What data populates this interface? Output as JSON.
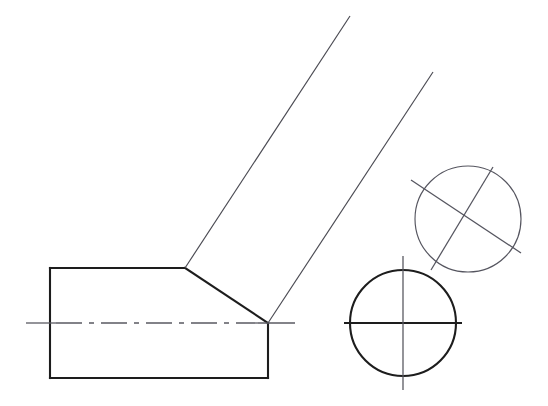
{
  "drawing": {
    "title": "Bent cylindrical part - orthographic technical drawing",
    "canvas": {
      "width": 548,
      "height": 406,
      "background": "#ffffff"
    },
    "colors": {
      "visible_edge": "#1d1d1d",
      "thin_edge": "#4a4a52",
      "center_line": "#5a5a62",
      "light_circle": "#55555f"
    },
    "views": [
      {
        "name": "front-view-bent-bar",
        "label": "Front view - bent bar with chamfered elbow",
        "axis_y": 323
      },
      {
        "name": "section-view-lower-circle",
        "label": "Section view - circular cross-section upright",
        "center_x": 403,
        "center_y": 323,
        "radius": 53
      },
      {
        "name": "section-view-upper-circle",
        "label": "Auxiliary section view - circular cross-section inclined",
        "center_x": 468,
        "center_y": 219,
        "radius": 53
      }
    ],
    "geometry": {
      "body_outline": "M 50,268 L 185,268 L 268,323 L 268,378 L 50,378 Z",
      "body_left_edge": "M 50,268 L 50,378",
      "body_top_edge": "M 50,268 L 185,268",
      "body_chamfer_edge": "M 185,268 L 268,323",
      "body_right_edge": "M 268,323 L 268,378",
      "body_bottom_edge": "M 50,378 L 268,378",
      "arm_left_edge": "M 185,268 L 350,16",
      "arm_right_edge": "M 268,323 L 433,72",
      "horizontal_centerline_solid_left": "M 26,323 L 56,323",
      "horizontal_centerline_dashed": "M 56,323 L 258,323",
      "horizontal_centerline_solid_right": "M 258,323 L 295,323",
      "lower_circle_h_centerline": "M 344,323 L 462,323",
      "lower_circle_v_centerline": "M 403,256 L 403,390",
      "upper_circle_diag_desc": "M 411,180 L 521,253",
      "upper_circle_diag_asc": "M 431,270 L 493,167"
    }
  }
}
